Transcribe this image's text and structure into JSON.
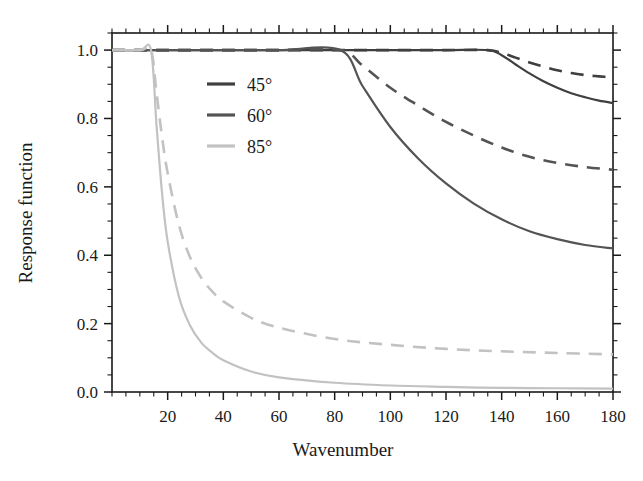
{
  "chart_data": {
    "type": "line",
    "title": "",
    "xlabel": "Wavenumber",
    "ylabel": "Response function",
    "xlim": [
      0,
      180
    ],
    "ylim": [
      0.0,
      1.05
    ],
    "xticks": [
      20,
      40,
      60,
      80,
      100,
      120,
      140,
      160,
      180
    ],
    "xtick_labels": [
      "20",
      "40",
      "60",
      "80",
      "100",
      "120",
      "140",
      "160",
      "180"
    ],
    "yticks": [
      0.0,
      0.2,
      0.4,
      0.6,
      0.8,
      1.0
    ],
    "ytick_labels": [
      "0.0",
      "0.2",
      "0.4",
      "0.6",
      "0.8",
      "1.0"
    ],
    "x_minor_tick_interval": 5,
    "y_minor_tick_interval": 0.05,
    "grid": false,
    "legend_position": "upper-left-inside",
    "frame": "box-all-four-sides",
    "tick_direction": "out",
    "legend": [
      {
        "label": "45°",
        "color": "#3f3f3f"
      },
      {
        "label": "60°",
        "color": "#545454"
      },
      {
        "label": "85°",
        "color": "#c2c2c2"
      }
    ],
    "series": [
      {
        "name": "45° solid",
        "angle": 45,
        "style": "solid",
        "color": "#3f3f3f",
        "cutoff_wavenumber": 135,
        "end_value": 0.845,
        "x": [
          0,
          20,
          40,
          60,
          80,
          100,
          120,
          135,
          140,
          145,
          150,
          155,
          160,
          165,
          170,
          175,
          180
        ],
        "y": [
          1.0,
          1.0,
          1.0,
          1.0,
          1.0,
          1.0,
          1.0,
          1.0,
          0.985,
          0.958,
          0.932,
          0.909,
          0.89,
          0.874,
          0.862,
          0.852,
          0.845
        ]
      },
      {
        "name": "45° dashed",
        "angle": 45,
        "style": "dashed",
        "color": "#3f3f3f",
        "cutoff_wavenumber": 135,
        "end_value": 0.92,
        "x": [
          0,
          20,
          40,
          60,
          80,
          100,
          120,
          135,
          140,
          145,
          150,
          155,
          160,
          165,
          170,
          175,
          180
        ],
        "y": [
          1.0,
          1.0,
          1.0,
          1.0,
          1.0,
          1.0,
          1.0,
          1.0,
          0.992,
          0.978,
          0.964,
          0.952,
          0.941,
          0.933,
          0.927,
          0.923,
          0.92
        ]
      },
      {
        "name": "60° solid",
        "angle": 60,
        "style": "solid",
        "color": "#545454",
        "cutoff_wavenumber": 82,
        "end_value": 0.42,
        "x": [
          0,
          20,
          40,
          60,
          82,
          90,
          100,
          110,
          120,
          130,
          140,
          150,
          160,
          170,
          180
        ],
        "y": [
          1.0,
          1.0,
          1.0,
          1.0,
          1.0,
          0.895,
          0.775,
          0.683,
          0.61,
          0.551,
          0.505,
          0.47,
          0.447,
          0.43,
          0.42
        ]
      },
      {
        "name": "60° dashed",
        "angle": 60,
        "style": "dashed",
        "color": "#545454",
        "cutoff_wavenumber": 82,
        "end_value": 0.65,
        "x": [
          0,
          20,
          40,
          60,
          82,
          90,
          100,
          110,
          120,
          130,
          140,
          150,
          160,
          170,
          180
        ],
        "y": [
          1.0,
          1.0,
          1.0,
          1.0,
          1.0,
          0.955,
          0.89,
          0.838,
          0.79,
          0.75,
          0.715,
          0.688,
          0.67,
          0.658,
          0.65
        ]
      },
      {
        "name": "85° solid",
        "angle": 85,
        "style": "solid",
        "color": "#c2c2c2",
        "cutoff_wavenumber": 14,
        "end_value": 0.01,
        "x": [
          0,
          10,
          14,
          16,
          18,
          20,
          24,
          28,
          32,
          36,
          40,
          50,
          60,
          80,
          100,
          120,
          140,
          160,
          180
        ],
        "y": [
          1.0,
          1.0,
          1.0,
          0.78,
          0.58,
          0.44,
          0.28,
          0.195,
          0.145,
          0.115,
          0.093,
          0.06,
          0.043,
          0.027,
          0.019,
          0.015,
          0.012,
          0.011,
          0.01
        ]
      },
      {
        "name": "85° dashed",
        "angle": 85,
        "style": "dashed",
        "color": "#c2c2c2",
        "cutoff_wavenumber": 14,
        "end_value": 0.11,
        "x": [
          0,
          10,
          14,
          16,
          18,
          20,
          24,
          28,
          32,
          36,
          40,
          50,
          60,
          80,
          100,
          120,
          140,
          160,
          180
        ],
        "y": [
          1.0,
          1.0,
          1.0,
          0.875,
          0.745,
          0.64,
          0.49,
          0.395,
          0.335,
          0.294,
          0.265,
          0.217,
          0.188,
          0.155,
          0.138,
          0.126,
          0.119,
          0.114,
          0.11
        ]
      }
    ]
  },
  "colors": {
    "axis": "#1a1a1a",
    "background": "#ffffff",
    "series_45": "#3f3f3f",
    "series_60": "#545454",
    "series_85": "#c2c2c2"
  }
}
